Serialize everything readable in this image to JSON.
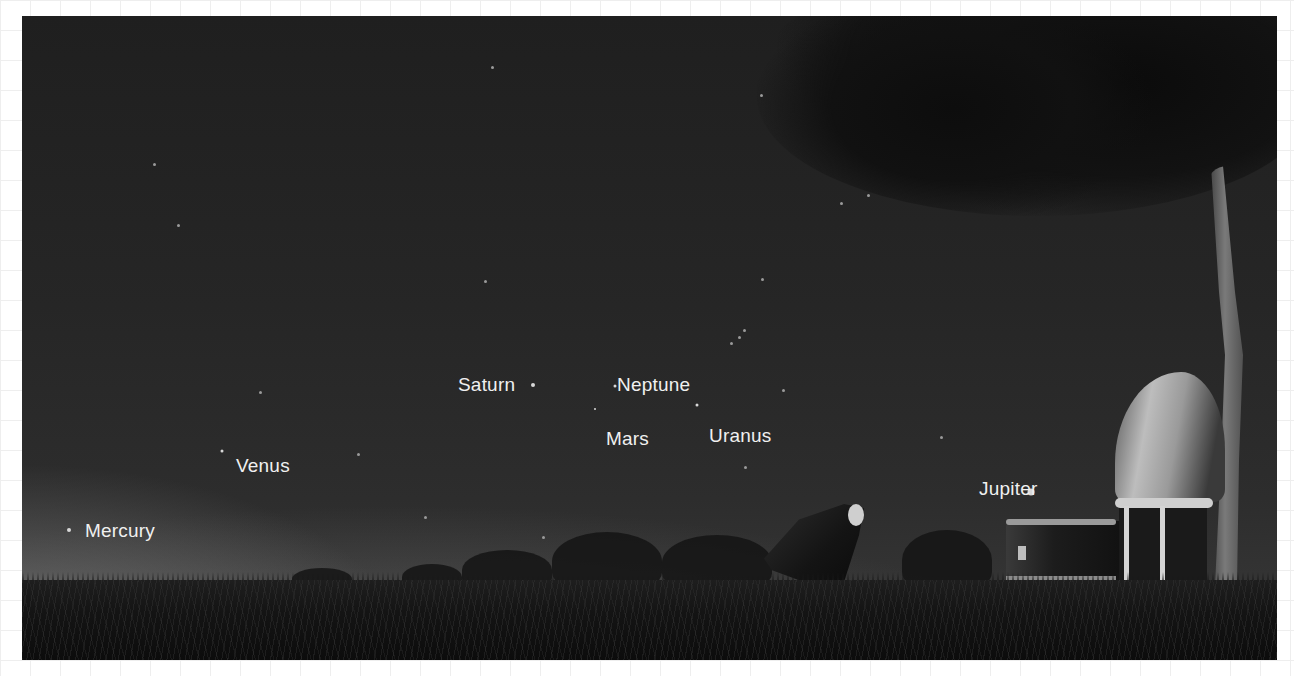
{
  "scene": {
    "description": "Night sky illustration with labeled planets above a grassy horizon, radio telescope and observatory",
    "colors": {
      "sky_top": "#1f1f1f",
      "sky_horizon_glow": "#969696",
      "label_text": "#f0f0f0",
      "planet_dot": "#d8d8d8"
    }
  },
  "planets": [
    {
      "name": "Mercury",
      "label_x": 63,
      "label_y": 505,
      "dot_x": 47,
      "dot_y": 514,
      "dot_size": 4
    },
    {
      "name": "Venus",
      "label_x": 214,
      "label_y": 440,
      "dot_x": 200,
      "dot_y": 435,
      "dot_size": 3
    },
    {
      "name": "Saturn",
      "label_x": 436,
      "label_y": 359,
      "dot_x": 511,
      "dot_y": 369,
      "dot_size": 4
    },
    {
      "name": "Neptune",
      "label_x": 595,
      "label_y": 359,
      "dot_x": 593,
      "dot_y": 370,
      "dot_size": 3
    },
    {
      "name": "Mars",
      "label_x": 584,
      "label_y": 413,
      "dot_x": 573,
      "dot_y": 393,
      "dot_size": 2
    },
    {
      "name": "Uranus",
      "label_x": 687,
      "label_y": 410,
      "dot_x": 675,
      "dot_y": 389,
      "dot_size": 3
    },
    {
      "name": "Jupiter",
      "label_x": 957,
      "label_y": 463,
      "dot_x": 1009,
      "dot_y": 476,
      "dot_size": 7
    }
  ],
  "stars": [
    [
      131,
      147
    ],
    [
      155,
      208
    ],
    [
      469,
      50
    ],
    [
      462,
      264
    ],
    [
      738,
      78
    ],
    [
      739,
      262
    ],
    [
      708,
      326
    ],
    [
      716,
      320
    ],
    [
      721,
      313
    ],
    [
      760,
      373
    ],
    [
      918,
      420
    ],
    [
      722,
      450
    ],
    [
      335,
      437
    ],
    [
      237,
      375
    ],
    [
      818,
      186
    ],
    [
      845,
      178
    ],
    [
      402,
      500
    ],
    [
      520,
      520
    ]
  ]
}
